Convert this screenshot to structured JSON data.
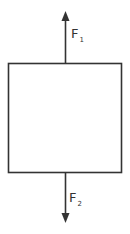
{
  "diagram": {
    "type": "free-body diagram",
    "body": {
      "shape": "rectangle"
    },
    "forces": [
      {
        "name": "F",
        "subscript": "1",
        "direction": "up"
      },
      {
        "name": "F",
        "subscript": "2",
        "direction": "down"
      }
    ],
    "colors": {
      "stroke": "#333333",
      "background": "#ffffff"
    }
  }
}
